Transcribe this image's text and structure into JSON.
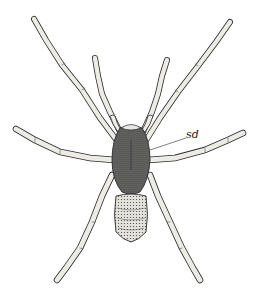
{
  "figure": {
    "labels": [
      {
        "text": "sd",
        "x": 186,
        "y": 130
      }
    ],
    "colors": {
      "background": "#ffffff",
      "ink": "#2a2a2a",
      "leg_fill": "#ecebe6",
      "carapace_fill": "#5a5a58",
      "abdomen_fill": "#d9d8d2"
    }
  }
}
